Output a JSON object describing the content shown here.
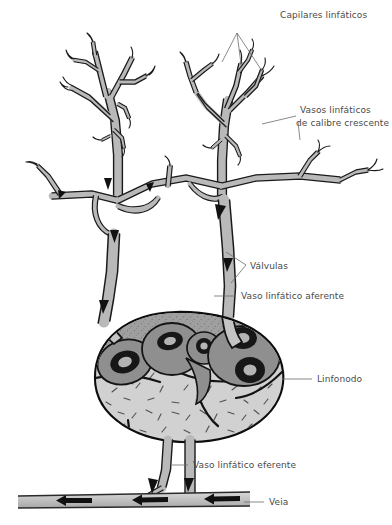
{
  "figure": {
    "title_alt": "Diagrama do sistema linfático: capilares, vasos, linfonodo e veia",
    "background_color": "#ffffff",
    "line_color": "#1a1a1a",
    "vessel_fill_color": "#c6c6c6",
    "node_cortex_color": "#9a9a9a",
    "node_medulla_color": "#cccccc",
    "follicle_ring_color": "#1a1a1a",
    "label_color": "#4a4a4a",
    "leader_color": "#6b6b6b"
  },
  "labels": {
    "capilares": "Capilares linfáticos",
    "vasos_line1": "Vasos linfáticos",
    "vasos_line2": "de calibre crescente",
    "valvulas": "Válvulas",
    "aferente": "Vaso linfático aferente",
    "linfonodo": "Linfonodo",
    "eferente": "Vaso linfático eferente",
    "veia": "Veia"
  },
  "structures": [
    {
      "name": "capilares-linfaticos",
      "role": "Rede de capilares linfáticos ramificados em dois tufos"
    },
    {
      "name": "vasos-calibre-crescente",
      "role": "Vasos linfáticos de calibre crescente"
    },
    {
      "name": "valvulas",
      "role": "Válvulas no interior dos vasos aferentes"
    },
    {
      "name": "vaso-linfatico-aferente",
      "role": "Vasos aferentes que chegam ao linfonodo"
    },
    {
      "name": "linfonodo",
      "role": "Linfonodo com córtex nodular e medula"
    },
    {
      "name": "vaso-linfatico-eferente",
      "role": "Vasos eferentes que saem do hilo"
    },
    {
      "name": "veia",
      "role": "Veia receptora do fluxo linfático"
    }
  ],
  "flow_arrows": {
    "count": 9,
    "direction_lymph": "descendente, em direção ao linfonodo",
    "direction_vein": "para a esquerda"
  }
}
